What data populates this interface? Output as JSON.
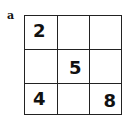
{
  "label": "a",
  "grid": {
    "rows": 3,
    "cols": 3,
    "cells": [
      [
        "2",
        "",
        ""
      ],
      [
        "",
        "5",
        ""
      ],
      [
        "4",
        "",
        "8"
      ]
    ]
  }
}
